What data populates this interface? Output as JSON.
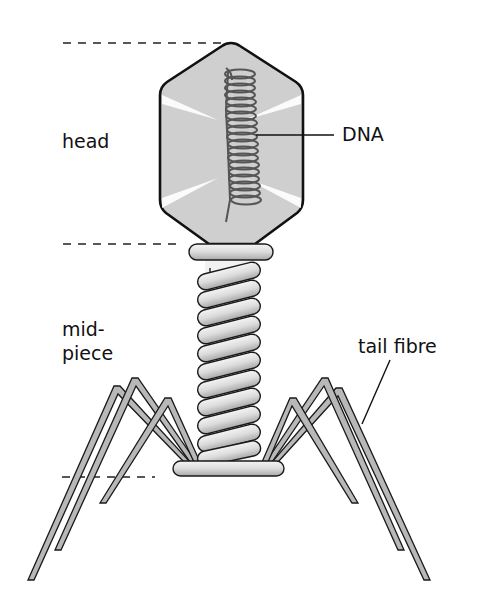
{
  "diagram": {
    "labels": {
      "head": "head",
      "dna": "DNA",
      "midpiece_line1": "mid-",
      "midpiece_line2": "piece",
      "tail_fibre": "tail fibre"
    },
    "colors": {
      "outline": "#1a1a1a",
      "head_fill": "#cfcfcf",
      "dna_strand": "#555555",
      "sheath_fill": "#d8d8d8",
      "fibre_fill": "#b8b8b8",
      "background": "#ffffff"
    }
  }
}
